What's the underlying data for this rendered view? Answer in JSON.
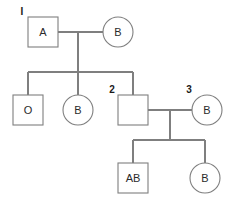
{
  "diagram": {
    "type": "pedigree-chart",
    "title": "",
    "colors": {
      "background": "#ffffff",
      "line": "#7f7f7f",
      "shape_fill": "#ffffff",
      "text": "#2b2b2b",
      "id_text": "#1a1a1a"
    },
    "generations": [
      {
        "name": "generation-1",
        "individuals": [
          {
            "id": "I",
            "sex": "male",
            "shape": "square",
            "label": "A",
            "id_label": "I",
            "x": 43,
            "y": 32,
            "size": 30
          },
          {
            "id": "",
            "sex": "female",
            "shape": "circle",
            "label": "B",
            "id_label": "",
            "x": 118,
            "y": 32,
            "size": 30
          }
        ]
      },
      {
        "name": "generation-2",
        "individuals": [
          {
            "id": "",
            "sex": "male",
            "shape": "square",
            "label": "O",
            "id_label": "",
            "x": 28,
            "y": 110,
            "size": 30
          },
          {
            "id": "",
            "sex": "female",
            "shape": "circle",
            "label": "B",
            "id_label": "",
            "x": 78,
            "y": 110,
            "size": 30
          },
          {
            "id": "2",
            "sex": "male",
            "shape": "square",
            "label": "",
            "id_label": "2",
            "x": 133,
            "y": 110,
            "size": 30
          },
          {
            "id": "3",
            "sex": "female",
            "shape": "circle",
            "label": "B",
            "id_label": "3",
            "x": 207,
            "y": 110,
            "size": 30
          }
        ]
      },
      {
        "name": "generation-3",
        "individuals": [
          {
            "id": "",
            "sex": "male",
            "shape": "square",
            "label": "AB",
            "id_label": "",
            "x": 133,
            "y": 178,
            "size": 30
          },
          {
            "id": "",
            "sex": "female",
            "shape": "circle",
            "label": "B",
            "id_label": "",
            "x": 205,
            "y": 178,
            "size": 30
          }
        ]
      }
    ],
    "matings": [
      {
        "name": "mating-gen1",
        "partner_a": "A",
        "partner_b": "B",
        "line_y": 32,
        "from_x": 58,
        "to_x": 103,
        "descent_x": 78,
        "descent_to_y": 72
      },
      {
        "name": "mating-gen2",
        "partner_a": "2",
        "partner_b": "3",
        "line_y": 110,
        "from_x": 148,
        "to_x": 192,
        "descent_x": 170,
        "descent_to_y": 140
      }
    ],
    "sibships": [
      {
        "name": "sibship-gen2",
        "line_y": 72,
        "from_x": 28,
        "to_x": 133,
        "children_x": [
          28,
          78,
          133
        ],
        "child_top_y": 95
      },
      {
        "name": "sibship-gen3",
        "line_y": 140,
        "from_x": 133,
        "to_x": 205,
        "children_x": [
          133,
          205
        ],
        "child_top_y": 163
      }
    ],
    "labels": {
      "square_a": "A",
      "circle_b_gen1": "B",
      "square_o": "O",
      "circle_b_gen2": "B",
      "square_empty_gen2": "",
      "circle_b_gen2_right": "B",
      "square_ab": "AB",
      "circle_b_gen3": "B",
      "id_one": "I",
      "id_two": "2",
      "id_three": "3"
    }
  }
}
